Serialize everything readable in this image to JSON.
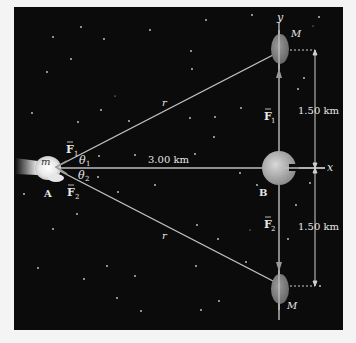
{
  "diagram": {
    "type": "gravitational force diagram",
    "axes": {
      "x_label": "x",
      "y_label": "y"
    },
    "objects": {
      "spacecraft": {
        "mass_label": "m",
        "point_label": "A"
      },
      "asteroid_top": {
        "mass_label": "M"
      },
      "asteroid_bottom": {
        "mass_label": "M"
      },
      "planet": {
        "point_label": "B"
      }
    },
    "forces": {
      "f1_left": "F",
      "f1_left_sub": "1",
      "f2_left": "F",
      "f2_left_sub": "2",
      "f1_right": "F",
      "f1_right_sub": "1",
      "f2_right": "F",
      "f2_right_sub": "2"
    },
    "angles": {
      "theta1": "θ",
      "theta1_sub": "1",
      "theta2": "θ",
      "theta2_sub": "2"
    },
    "distances": {
      "r_upper": "r",
      "r_lower": "r",
      "horizontal": "3.00 km",
      "upper_vertical": "1.50 km",
      "lower_vertical": "1.50 km"
    },
    "colors": {
      "background": "#0b0b0b",
      "line": "#bdbdbd",
      "asteroid": "#8a8a8a",
      "label": "#e6e6e6"
    }
  }
}
